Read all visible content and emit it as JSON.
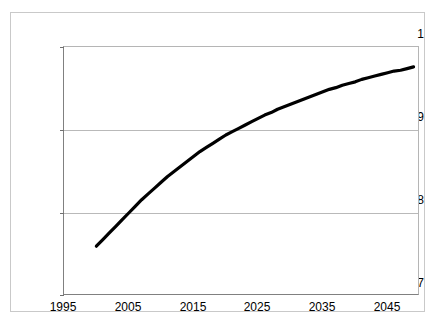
{
  "chart_data": {
    "type": "line",
    "title": "",
    "subtitle": "",
    "xlabel": "",
    "ylabel": "",
    "xlim": [
      1995,
      2050
    ],
    "ylim": [
      0.7,
      1.0
    ],
    "grid": true,
    "legend": null,
    "x_ticks": [
      "1995",
      "2005",
      "2015",
      "2025",
      "2035",
      "2045"
    ],
    "x_tick_values": [
      1995,
      2005,
      2015,
      2025,
      2035,
      2045
    ],
    "y_ticks": [
      "0.7",
      "0.8",
      "0.9",
      "1"
    ],
    "y_tick_values": [
      0.7,
      0.8,
      0.9,
      1.0
    ],
    "line_color": "#000000",
    "line_width": 3,
    "series": [
      {
        "name": "ratio",
        "x": [
          2000,
          2001,
          2002,
          2003,
          2004,
          2005,
          2006,
          2007,
          2008,
          2009,
          2010,
          2011,
          2012,
          2013,
          2014,
          2015,
          2016,
          2017,
          2018,
          2019,
          2020,
          2021,
          2022,
          2023,
          2024,
          2025,
          2026,
          2027,
          2028,
          2029,
          2030,
          2031,
          2032,
          2033,
          2034,
          2035,
          2036,
          2037,
          2038,
          2039,
          2040,
          2041,
          2042,
          2043,
          2044,
          2045,
          2046,
          2047,
          2048,
          2049
        ],
        "values": [
          0.76,
          0.768,
          0.776,
          0.784,
          0.792,
          0.8,
          0.808,
          0.816,
          0.823,
          0.83,
          0.837,
          0.844,
          0.85,
          0.856,
          0.862,
          0.868,
          0.874,
          0.879,
          0.884,
          0.889,
          0.894,
          0.898,
          0.902,
          0.906,
          0.91,
          0.914,
          0.918,
          0.921,
          0.925,
          0.928,
          0.931,
          0.934,
          0.937,
          0.94,
          0.943,
          0.946,
          0.949,
          0.951,
          0.954,
          0.956,
          0.958,
          0.961,
          0.963,
          0.965,
          0.967,
          0.969,
          0.971,
          0.972,
          0.974,
          0.976
        ]
      }
    ]
  },
  "axes": {
    "y_labels": [
      "1",
      "0.9",
      "0.8",
      "0.7"
    ],
    "x_labels": [
      "1995",
      "2005",
      "2015",
      "2025",
      "2035",
      "2045"
    ]
  }
}
